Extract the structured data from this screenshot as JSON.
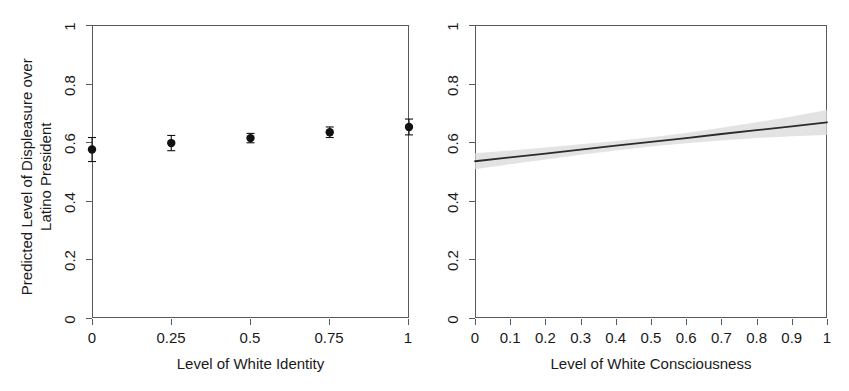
{
  "figure": {
    "background": "#ffffff",
    "frame_color": "#555a5e",
    "text_color": "#1a1a1a"
  },
  "chart_data": [
    {
      "id": "left",
      "type": "scatter",
      "title": "",
      "xlabel": "Level of White Identity",
      "ylabel": "Predicted Level of Displeasure over\nLatino President",
      "ylabel_line1": "Predicted Level of Displeasure over",
      "ylabel_line2": "Latino President",
      "xlim": [
        0,
        1
      ],
      "ylim": [
        0,
        1
      ],
      "grid": false,
      "legend": "none",
      "marker": "filled-circle",
      "marker_color": "#111111",
      "errorbar_color": "#111111",
      "xticks": [
        0,
        0.25,
        0.5,
        0.75,
        1
      ],
      "xticklabels": [
        "0",
        "0.25",
        "0.5",
        "0.75",
        "1"
      ],
      "yticks": [
        0,
        0.2,
        0.4,
        0.6,
        0.8,
        1
      ],
      "yticklabels": [
        "0",
        "0.2",
        "0.4",
        "0.6",
        "0.8",
        "1"
      ],
      "x": [
        0,
        0.25,
        0.5,
        0.75,
        1
      ],
      "y": [
        0.575,
        0.597,
        0.614,
        0.634,
        0.652
      ],
      "y_lower": [
        0.534,
        0.571,
        0.598,
        0.616,
        0.625
      ],
      "y_upper": [
        0.616,
        0.623,
        0.63,
        0.652,
        0.679
      ]
    },
    {
      "id": "right",
      "type": "line",
      "title": "",
      "xlabel": "Level of White Consciousness",
      "ylabel": "",
      "xlim": [
        0,
        1
      ],
      "ylim": [
        0,
        1
      ],
      "grid": false,
      "legend": "none",
      "line_color": "#2b2b2b",
      "band_color": "#d9d9d9",
      "band_label": "confidence interval",
      "xticks": [
        0,
        0.1,
        0.2,
        0.3,
        0.4,
        0.5,
        0.6,
        0.7,
        0.8,
        0.9,
        1
      ],
      "xticklabels": [
        "0",
        "0.1",
        "0.2",
        "0.3",
        "0.4",
        "0.5",
        "0.6",
        "0.7",
        "0.8",
        "0.9",
        "1"
      ],
      "yticks": [
        0,
        0.2,
        0.4,
        0.6,
        0.8,
        1
      ],
      "yticklabels": [
        "0",
        "0.2",
        "0.4",
        "0.6",
        "0.8",
        "1"
      ],
      "x": [
        0,
        0.1,
        0.2,
        0.3,
        0.4,
        0.5,
        0.6,
        0.7,
        0.8,
        0.9,
        1
      ],
      "y": [
        0.535,
        0.548,
        0.561,
        0.575,
        0.588,
        0.601,
        0.614,
        0.628,
        0.641,
        0.654,
        0.668
      ],
      "y_lower": [
        0.508,
        0.525,
        0.541,
        0.557,
        0.572,
        0.585,
        0.596,
        0.606,
        0.614,
        0.62,
        0.625
      ],
      "y_upper": [
        0.562,
        0.572,
        0.582,
        0.593,
        0.604,
        0.617,
        0.631,
        0.649,
        0.668,
        0.688,
        0.71
      ]
    }
  ]
}
